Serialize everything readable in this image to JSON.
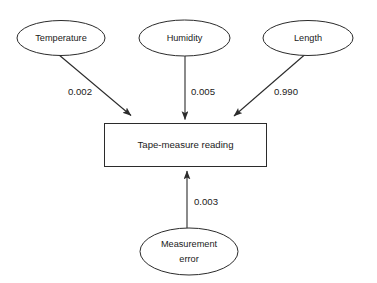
{
  "diagram": {
    "type": "path-diagram",
    "background_color": "#ffffff",
    "line_color": "#2b2b2b",
    "text_color": "#1a1a1a",
    "nodes": [
      {
        "id": "temperature",
        "label": "Temperature",
        "shape": "ellipse"
      },
      {
        "id": "humidity",
        "label": "Humidity",
        "shape": "ellipse"
      },
      {
        "id": "length",
        "label": "Length",
        "shape": "ellipse"
      },
      {
        "id": "tape_measure_reading",
        "label": "Tape-measure reading",
        "shape": "rectangle"
      },
      {
        "id": "measurement_error",
        "label_line1": "Measurement",
        "label_line2": "error",
        "shape": "ellipse"
      }
    ],
    "edges": [
      {
        "from": "temperature",
        "to": "tape_measure_reading",
        "weight": "0.002"
      },
      {
        "from": "humidity",
        "to": "tape_measure_reading",
        "weight": "0.005"
      },
      {
        "from": "length",
        "to": "tape_measure_reading",
        "weight": "0.990"
      },
      {
        "from": "measurement_error",
        "to": "tape_measure_reading",
        "weight": "0.003"
      }
    ]
  }
}
